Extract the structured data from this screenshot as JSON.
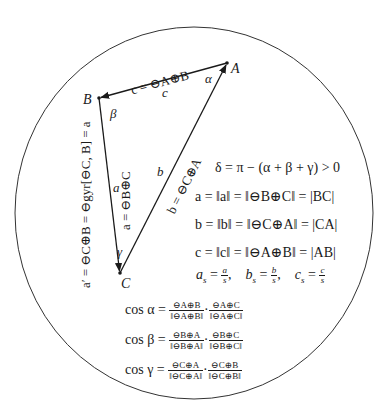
{
  "diagram": {
    "type": "gyrotriangle",
    "disk": {
      "center": [
        194,
        213
      ],
      "rx": 179,
      "ry": 186
    },
    "vertices": {
      "A": {
        "label": "A",
        "pos": [
          227,
          63
        ]
      },
      "B": {
        "label": "B",
        "pos": [
          99,
          98
        ]
      },
      "C": {
        "label": "C",
        "pos": [
          120,
          273
        ]
      }
    },
    "angles": {
      "alpha": "α",
      "beta": "β",
      "gamma": "γ"
    },
    "sides": {
      "c": {
        "label": "c",
        "vector": "c = ⊖A⊕B"
      },
      "a": {
        "label": "a",
        "vector": "a = ⊖B⊕C"
      },
      "b": {
        "label": "b",
        "vector": "b = ⊖C⊕A"
      },
      "a_prime": "a′ = ⊖C⊕B = ⊖gyr[⊖C, B] = a"
    }
  },
  "equations": {
    "defect": "δ = π − (α + β + γ) > 0",
    "a_len": "a = ‖a‖ = ‖⊖B⊕C‖ = |BC|",
    "b_len": "b = ‖b‖ = ‖⊖C⊕A‖ = |CA|",
    "c_len": "c = ‖c‖ = ‖⊖A⊕B‖ = |AB|",
    "scaled": {
      "as": {
        "lhs": "a",
        "sub": "s",
        "num": "a",
        "den": "s"
      },
      "bs": {
        "lhs": "b",
        "sub": "s",
        "num": "b",
        "den": "s"
      },
      "cs": {
        "lhs": "c",
        "sub": "s",
        "num": "c",
        "den": "s"
      }
    },
    "cos": [
      {
        "lhs": "cos α",
        "n1": "⊖A⊕B",
        "d1": "‖⊖A⊕B‖",
        "n2": "⊖A⊕C",
        "d2": "‖⊖A⊕C‖"
      },
      {
        "lhs": "cos β",
        "n1": "⊖B⊕A",
        "d1": "‖⊖B⊕A‖",
        "n2": "⊖B⊕C",
        "d2": "‖⊖B⊕C‖"
      },
      {
        "lhs": "cos γ",
        "n1": "⊖C⊕A",
        "d1": "‖⊖C⊕A‖",
        "n2": "⊖C⊕B",
        "d2": "‖⊖C⊕B‖"
      }
    ]
  }
}
